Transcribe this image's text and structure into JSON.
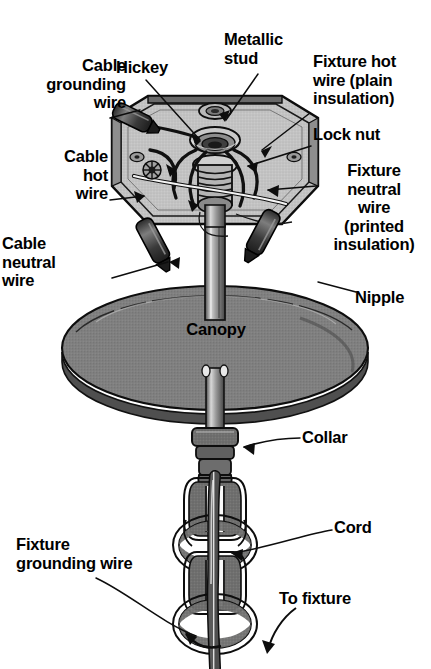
{
  "figure": {
    "background_color": "#ffffff",
    "ink_color": "#000000",
    "canopy_gray": "#808080",
    "chain_gray": "#6f6f6f",
    "box_gray": "#bdbdbd",
    "width": 431,
    "height": 669
  },
  "labels": {
    "cable_grounding_wire": "Cable\ngrounding\nwire",
    "hickey": "Hickey",
    "metallic_stud": "Metallic\nstud",
    "fixture_hot_wire": "Fixture hot\nwire (plain\ninsulation)",
    "lock_nut": "Lock nut",
    "cable_hot_wire": "Cable\nhot\nwire",
    "fixture_neutral_wire": "Fixture\nneutral\nwire\n(printed\ninsulation)",
    "cable_neutral_wire": "Cable\nneutral\nwire",
    "nipple": "Nipple",
    "canopy": "Canopy",
    "collar": "Collar",
    "cord": "Cord",
    "fixture_grounding_wire": "Fixture\ngrounding wire",
    "to_fixture": "To fixture"
  },
  "parts": [
    {
      "name": "electrical-box",
      "shape": "octagonal junction box, cutaway, light gray fill"
    },
    {
      "name": "hickey",
      "shape": "threaded fitting inside box"
    },
    {
      "name": "metallic-stud",
      "shape": "stud at box top center"
    },
    {
      "name": "lock-nut",
      "shape": "knurled nut on nipple"
    },
    {
      "name": "nipple",
      "shape": "threaded tube through canopy"
    },
    {
      "name": "canopy",
      "shape": "large gray ellipse dome"
    },
    {
      "name": "collar",
      "shape": "ring clamp under canopy"
    },
    {
      "name": "chain",
      "shape": "four interlocking oval links"
    },
    {
      "name": "cord",
      "shape": "cable running through chain"
    },
    {
      "name": "wire-nut-left",
      "shape": "dark connector angled lower-left"
    },
    {
      "name": "wire-nut-right",
      "shape": "dark connector angled lower-right"
    }
  ]
}
